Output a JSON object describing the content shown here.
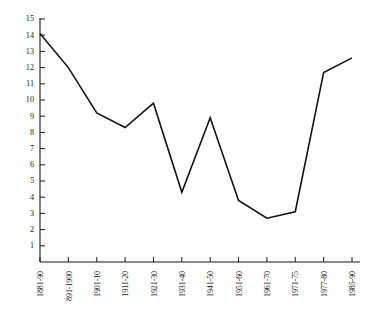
{
  "chart_data": {
    "type": "line",
    "title": "",
    "subtitle": "",
    "xlabel": "",
    "ylabel": "",
    "categories": [
      "1881-90",
      "891-1900",
      "1901-10",
      "1911-20",
      "1921-30",
      "1931-40",
      "1941-50",
      "1951-60",
      "1961-70",
      "1971-75",
      "1977-80",
      "1985-90"
    ],
    "values": [
      14.1,
      12.0,
      9.2,
      8.3,
      9.8,
      4.3,
      8.9,
      3.8,
      2.7,
      3.1,
      11.7,
      12.6
    ],
    "series": [
      {
        "name": "",
        "values": [
          14.1,
          12.0,
          9.2,
          8.3,
          9.8,
          4.3,
          8.9,
          3.8,
          2.7,
          3.1,
          11.7,
          12.6
        ]
      }
    ],
    "ylim": [
      0,
      15
    ],
    "xlim": [
      0,
      11
    ],
    "y_ticks": [
      0,
      1,
      2,
      3,
      4,
      5,
      6,
      7,
      8,
      9,
      10,
      11,
      12,
      13,
      14,
      15
    ],
    "y_tick_labels": [
      "",
      "1",
      "2",
      "3",
      "4",
      "5",
      "6",
      "7",
      "8",
      "9",
      "10",
      "11",
      "12",
      "13",
      "14",
      "15"
    ],
    "grid": false,
    "legend": false,
    "legend_position": "none",
    "line_color": "#111111",
    "axis_color": "#1a1a1a",
    "background_color": "#ffffff",
    "x_label_rotation": -90,
    "annotations": []
  },
  "axis": {
    "y_axis_name": "y-axis",
    "x_axis_name": "x-axis"
  }
}
